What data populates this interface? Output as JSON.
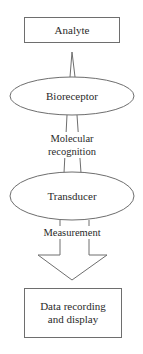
{
  "nodes": {
    "analyte": "Analyte",
    "bioreceptor": "Bioreceptor",
    "transducer": "Transducer",
    "output": "Data recording and display"
  },
  "edges": {
    "recognition_line1": "Molecular",
    "recognition_line2": "recognition",
    "measurement": "Measurement"
  },
  "colors": {
    "stroke": "#6e6e6e",
    "text": "#2a2a2a",
    "background": "#ffffff"
  }
}
